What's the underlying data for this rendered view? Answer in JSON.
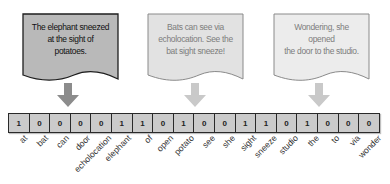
{
  "documents": [
    {
      "id": "doc1",
      "text_lines": [
        "The elephant sneezed",
        "at the sight of potatoes."
      ],
      "fill": "#b9b9b9",
      "stroke": "#1e1e1e",
      "text_color": "#111111",
      "arrow_color": "#8c8c8c",
      "emphasis": "active"
    },
    {
      "id": "doc2",
      "text_lines": [
        "Bats can see via",
        "echolocation. See the",
        "bat sight sneeze!"
      ],
      "fill": "#e2e2e2",
      "stroke": "#8a8a8a",
      "text_color": "#7d7d7d",
      "arrow_color": "#c9c9c9",
      "emphasis": "faded"
    },
    {
      "id": "doc3",
      "text_lines": [
        "Wondering, she opened",
        "the door to the studio."
      ],
      "fill": "#ececec",
      "stroke": "#8a8a8a",
      "text_color": "#7d7d7d",
      "arrow_color": "#c9c9c9",
      "emphasis": "faded"
    }
  ],
  "vector": {
    "vocabulary": [
      "at",
      "bat",
      "can",
      "door",
      "echolocation",
      "elephant",
      "of",
      "open",
      "potato",
      "see",
      "she",
      "sight",
      "sneeze",
      "studio",
      "the",
      "to",
      "via",
      "wonder"
    ],
    "values": [
      "1",
      "0",
      "0",
      "0",
      "0",
      "1",
      "1",
      "0",
      "1",
      "0",
      "0",
      "1",
      "1",
      "0",
      "1",
      "0",
      "0",
      "0"
    ]
  }
}
